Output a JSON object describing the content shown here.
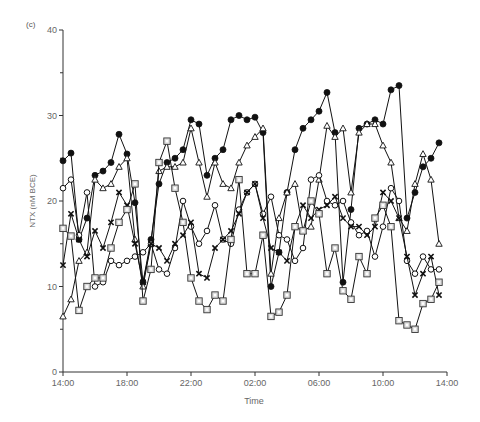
{
  "chart_data": {
    "type": "line",
    "panel_label": "(c)",
    "title": "",
    "xlabel": "Time",
    "ylabel": "NTX (nM BCE)",
    "ylim": [
      0,
      40
    ],
    "yticks": [
      0,
      10,
      20,
      30,
      40
    ],
    "xtick_labels": [
      "14:00",
      "18:00",
      "22:00",
      "02:00",
      "06:00",
      "10:00",
      "14:00"
    ],
    "grid": false,
    "legend": null,
    "x_hours": [
      0,
      0.5,
      1,
      1.5,
      2,
      2.5,
      3,
      3.5,
      4,
      4.5,
      5,
      5.5,
      6,
      6.5,
      7,
      7.5,
      8,
      8.5,
      9,
      9.5,
      10,
      10.5,
      11,
      11.5,
      12,
      12.5,
      13,
      13.5,
      14,
      14.5,
      15,
      15.5,
      16,
      16.5,
      17,
      17.5,
      18,
      18.5,
      19,
      19.5,
      20,
      20.5,
      21,
      21.5,
      22,
      22.5,
      23,
      23.5
    ],
    "series": [
      {
        "name": "filled-circle",
        "marker": "circle-filled",
        "values": [
          24.7,
          25.6,
          15.5,
          18.0,
          23.0,
          23.5,
          24.5,
          27.8,
          25.5,
          19.8,
          10.5,
          15.5,
          22.0,
          24.5,
          25.0,
          26.0,
          29.5,
          29.0,
          23.0,
          25.0,
          26.0,
          29.5,
          30.0,
          29.5,
          29.8,
          28.0,
          10.0,
          14.0,
          21.0,
          26.0,
          28.5,
          29.5,
          30.5,
          32.7,
          28.0,
          10.5,
          19.0,
          28.5,
          29.0,
          29.5,
          29.0,
          33.0,
          33.5,
          18.0,
          21.0,
          24.0,
          25.0,
          26.8
        ]
      },
      {
        "name": "open-triangle",
        "marker": "triangle-open",
        "values": [
          6.5,
          8.5,
          13.0,
          14.0,
          22.5,
          21.5,
          22.0,
          24.0,
          25.0,
          15.5,
          10.0,
          15.0,
          23.5,
          24.0,
          24.0,
          24.5,
          28.5,
          24.5,
          20.5,
          24.5,
          22.0,
          21.5,
          24.5,
          26.5,
          27.5,
          28.5,
          11.5,
          18.0,
          21.0,
          22.0,
          16.5,
          17.0,
          22.5,
          28.8,
          27.5,
          28.5,
          21.0,
          28.0,
          29.0,
          29.0,
          26.5,
          24.5,
          18.0,
          16.5,
          22.0,
          25.5,
          22.5,
          15.0
        ]
      },
      {
        "name": "open-diamond",
        "marker": "diamond-open",
        "values": [
          21.5,
          22.5,
          16.0,
          21.0,
          10.0,
          10.5,
          13.0,
          12.5,
          13.0,
          13.5,
          14.0,
          15.0,
          12.0,
          11.5,
          14.5,
          20.0,
          17.0,
          15.0,
          16.5,
          19.5,
          15.5,
          15.0,
          19.0,
          21.0,
          22.0,
          18.5,
          20.5,
          16.0,
          15.5,
          13.0,
          14.5,
          22.5,
          23.0,
          20.0,
          19.5,
          20.0,
          17.5,
          16.0,
          16.5,
          13.5,
          17.0,
          21.5,
          20.0,
          13.0,
          11.5,
          13.5,
          12.0,
          12.0
        ]
      },
      {
        "name": "cross",
        "marker": "x",
        "values": [
          12.5,
          18.5,
          15.5,
          13.5,
          16.5,
          14.5,
          17.5,
          21.0,
          19.5,
          15.0,
          10.5,
          15.0,
          14.5,
          13.0,
          15.0,
          16.0,
          17.5,
          11.5,
          11.0,
          14.5,
          15.5,
          16.5,
          18.5,
          21.0,
          22.0,
          18.0,
          14.5,
          14.0,
          13.0,
          17.0,
          19.5,
          18.0,
          19.0,
          19.5,
          20.5,
          18.0,
          17.0,
          17.0,
          16.0,
          17.0,
          21.0,
          20.0,
          18.0,
          13.5,
          9.0,
          11.5,
          13.5,
          9.0
        ]
      },
      {
        "name": "open-square",
        "marker": "square-open",
        "values": [
          16.8,
          15.9,
          7.2,
          10.0,
          11.0,
          11.0,
          14.5,
          17.5,
          19.0,
          22.0,
          8.3,
          12.0,
          24.5,
          27.0,
          21.5,
          17.5,
          11.0,
          8.3,
          7.3,
          9.0,
          8.3,
          15.5,
          22.5,
          11.5,
          11.5,
          16.0,
          6.5,
          7.0,
          9.0,
          17.0,
          16.5,
          20.0,
          18.5,
          11.5,
          14.5,
          9.5,
          8.5,
          13.5,
          11.5,
          18.0,
          19.5,
          17.0,
          6.0,
          5.5,
          5.0,
          8.0,
          8.5,
          10.5
        ]
      }
    ]
  }
}
